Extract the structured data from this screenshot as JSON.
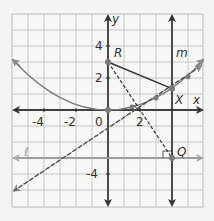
{
  "diagram": {
    "axes": {
      "x_label": "x",
      "y_label": "y",
      "x_ticks": [
        "-4",
        "-2",
        "2"
      ],
      "y_ticks": [
        "4",
        "2",
        "-4"
      ],
      "origin_label": "0"
    },
    "points": {
      "R": "R",
      "X": "X",
      "Q": "Q"
    },
    "lines": {
      "m": "m",
      "l": "ℓ"
    },
    "colors": {
      "grid": "#b9b9b9",
      "axis": "#333333",
      "parabola": "#777777",
      "directrix": "#9a9a9a",
      "point": "#7a7a7a",
      "segment": "#333333",
      "background": "#f4f4f2"
    }
  }
}
